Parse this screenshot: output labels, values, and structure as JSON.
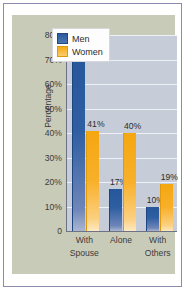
{
  "chart_data": {
    "type": "bar",
    "title": "",
    "xlabel": "",
    "ylabel": "Percentage",
    "categories": [
      "With Spouse",
      "Alone",
      "With Others"
    ],
    "category_lines": [
      [
        "With",
        "Spouse"
      ],
      [
        "Alone",
        ""
      ],
      [
        "With",
        "Others"
      ]
    ],
    "series": [
      {
        "name": "Men",
        "color": "#2d5a9e",
        "values": [
          73,
          17,
          10
        ],
        "labels": [
          "73%",
          "17%",
          "10%"
        ]
      },
      {
        "name": "Women",
        "color": "#f5a711",
        "values": [
          41,
          40,
          19
        ],
        "labels": [
          "41%",
          "40%",
          "19%"
        ]
      }
    ],
    "ylim": [
      0,
      80
    ],
    "yticks": [
      0,
      10,
      20,
      30,
      40,
      50,
      60,
      70,
      80
    ],
    "ytick_labels": [
      "0",
      "10%",
      "20%",
      "30%",
      "40%",
      "50%",
      "60%",
      "70%",
      "80%"
    ],
    "grid": true,
    "legend_position": "top-right",
    "legend_entries": [
      "Men",
      "Women"
    ]
  },
  "colors": {
    "men": "#2d5a9e",
    "women": "#f5a711",
    "panel_background": "#c9cbb9",
    "plot_background": "#c6ccd8",
    "gridline": "#eef1f6",
    "axis": "#6d7285",
    "figure_border": "#8b8bab"
  }
}
